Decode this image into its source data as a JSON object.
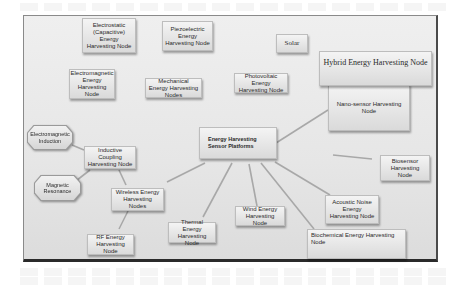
{
  "diagram": {
    "center": {
      "label": "Energy Harvesting Sensor Platforms"
    },
    "nodes": {
      "electrostatic": "Electrostatic (Capacitive) Energy Harvesting Node",
      "piezoelectric": "Piezoelectric Energy Harvesting Node",
      "solar": "Solar",
      "hybrid": "Hybrid Energy Harvesting Node",
      "electromagnetic": "Electromagnetic Energy Harvesting Node",
      "mechanical": "Mechanical Energy Harvesting Nodes",
      "photovoltaic": "Photovoltaic Energy Harvesting Node",
      "nanosensor": "Nano-sensor Harvesting Node",
      "em_induction": "Electromagnetic Induction",
      "inductive_coupling": "Inductive Coupling Harvesting Node",
      "magnetic_resonance": "Magnetic Resonance",
      "wireless": "Wireless Energy Harvesting Nodes",
      "rf": "RF Energy Harvesting Node",
      "thermal": "Thermal Energy Harvesting Node",
      "wind": "Wind Energy Harvesting Node",
      "biochemical": "Biochemical Energy Harvesting Node",
      "acoustic": "Acoustic Noise Energy Harvesting Node",
      "biosensor": "Biosensor Harvesting Node"
    },
    "edges": [
      [
        "center",
        "nanosensor"
      ],
      [
        "center",
        "wireless"
      ],
      [
        "center",
        "thermal"
      ],
      [
        "center",
        "wind"
      ],
      [
        "center",
        "biochemical"
      ],
      [
        "center",
        "acoustic"
      ],
      [
        "biosensor",
        "center-right"
      ],
      [
        "wireless",
        "inductive_coupling"
      ],
      [
        "wireless",
        "rf"
      ],
      [
        "inductive_coupling",
        "em_induction"
      ],
      [
        "inductive_coupling",
        "magnetic_resonance"
      ]
    ],
    "colors": {
      "frame_bg": "#e8e8e8",
      "node_bg": "#e2e2e2",
      "link": "#a8a8a8",
      "text": "#2a2a2a"
    }
  }
}
